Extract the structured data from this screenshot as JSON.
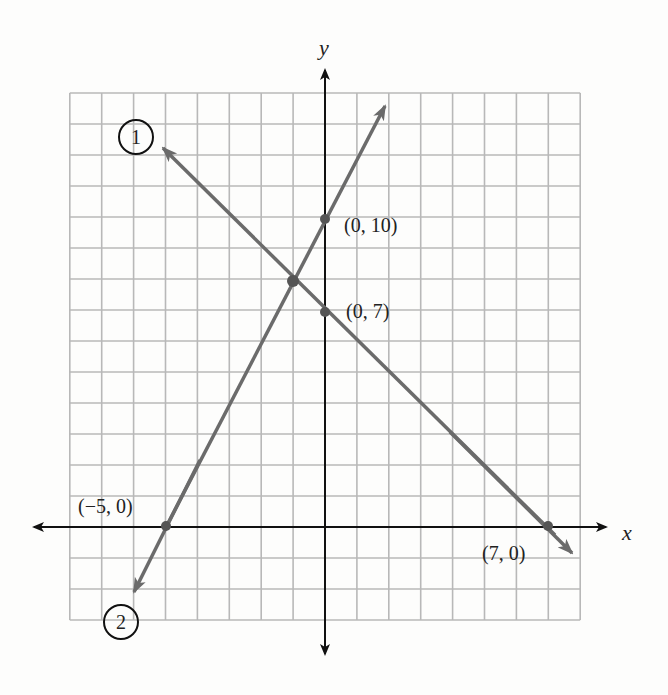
{
  "chart_data": {
    "type": "line",
    "title": "",
    "xlabel": "x",
    "ylabel": "y",
    "xlim": [
      -8,
      8
    ],
    "ylim": [
      -3,
      14
    ],
    "grid": true,
    "series": [
      {
        "name": "1",
        "label": "①",
        "equation": "y = 7 - x",
        "slope": -1,
        "intercept": 7,
        "points": [
          {
            "x": 0,
            "y": 7,
            "label": "(0, 7)"
          },
          {
            "x": 7,
            "y": 0,
            "label": "(7, 0)"
          }
        ],
        "color": "#6b6b6b"
      },
      {
        "name": "2",
        "label": "②",
        "equation": "y = 2x + 10",
        "slope": 2,
        "intercept": 10,
        "points": [
          {
            "x": 0,
            "y": 10,
            "label": "(0, 10)"
          },
          {
            "x": -5,
            "y": 0,
            "label": "(-5, 0)"
          }
        ],
        "color": "#6b6b6b"
      }
    ],
    "intersection": {
      "x": -1,
      "y": 8
    },
    "annotations": [
      "(0, 10)",
      "(0, 7)",
      "(−5, 0)",
      "(7, 0)",
      "1",
      "2"
    ]
  },
  "labels": {
    "x_axis": "x",
    "y_axis": "y",
    "p_0_10": "(0, 10)",
    "p_0_7": "(0, 7)",
    "p_m5_0": "(−5, 0)",
    "p_7_0": "(7, 0)",
    "line1_tag": "1",
    "line2_tag": "2"
  },
  "colors": {
    "grid": "#b8b8b8",
    "axis": "#111111",
    "line": "#6b6b6b"
  }
}
